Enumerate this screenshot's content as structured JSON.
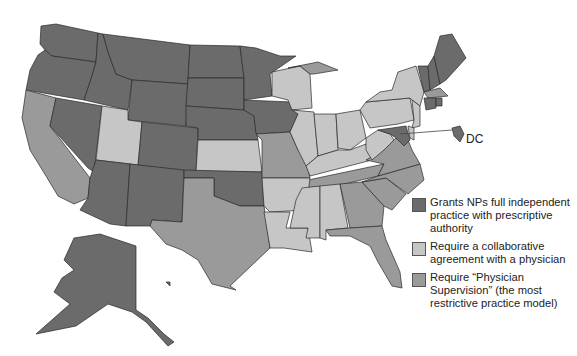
{
  "colors": {
    "independent": "#6b6b6b",
    "collaborative": "#c6c6c6",
    "supervision": "#9a9a9a"
  },
  "legend": {
    "items": [
      {
        "key": "independent",
        "label": "Grants NPs full independent practice with prescriptive authority"
      },
      {
        "key": "collaborative",
        "label": "Require a collaborative agreement with a physician"
      },
      {
        "key": "supervision",
        "label": "Require “Physician Supervision” (the most restrictive practice model)"
      }
    ]
  },
  "callout": {
    "label": "DC",
    "category": "independent"
  },
  "states": {
    "WA": "independent",
    "OR": "independent",
    "ID": "independent",
    "MT": "independent",
    "WY": "independent",
    "NV": "independent",
    "AZ": "independent",
    "NM": "independent",
    "CO": "independent",
    "ND": "independent",
    "SD": "independent",
    "NE": "independent",
    "MN": "independent",
    "IA": "independent",
    "OK": "independent",
    "AK": "independent",
    "HI": "independent",
    "ME": "independent",
    "NH": "independent",
    "VT": "independent",
    "RI": "independent",
    "CT": "independent",
    "MD": "independent",
    "DC": "independent",
    "CA": "supervision",
    "TX": "supervision",
    "MO": "supervision",
    "MI": "supervision",
    "GA": "supervision",
    "FL": "supervision",
    "NC": "supervision",
    "SC": "supervision",
    "VA": "supervision",
    "TN": "supervision",
    "MA": "supervision",
    "UT": "collaborative",
    "KS": "collaborative",
    "WI": "collaborative",
    "IL": "collaborative",
    "IN": "collaborative",
    "OH": "collaborative",
    "KY": "collaborative",
    "WV": "collaborative",
    "PA": "collaborative",
    "NY": "collaborative",
    "NJ": "collaborative",
    "DE": "collaborative",
    "AR": "collaborative",
    "LA": "collaborative",
    "MS": "collaborative",
    "AL": "collaborative"
  }
}
